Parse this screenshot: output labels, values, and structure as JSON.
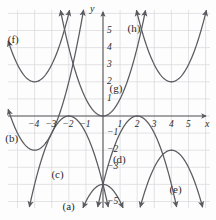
{
  "figure": {
    "kind": "coordinate-grid-parabolas",
    "background_color": "#fdfdfd",
    "grid_color": "#d8d8dc",
    "axis_color": "#58585c",
    "curve_color": "#5a5a60"
  },
  "axes": {
    "x_axis_label": "x",
    "y_axis_label": "y",
    "x_tick_labels": [
      "−4",
      "−3",
      "−2",
      "−1",
      "1",
      "2",
      "3",
      "4",
      "5"
    ],
    "x_tick_values": [
      -4,
      -3,
      -2,
      -1,
      1,
      2,
      3,
      4,
      5
    ],
    "y_tick_labels": [
      "5",
      "4",
      "3",
      "2",
      "1",
      "−1",
      "−2",
      "−3",
      "−5"
    ],
    "y_tick_values": [
      5,
      4,
      3,
      2,
      1,
      -1,
      -2,
      -3,
      -5
    ],
    "xlim": [
      -5.5,
      6.2
    ],
    "ylim": [
      -6.3,
      6.2
    ],
    "grid": true
  },
  "chart_data": {
    "type": "line",
    "title": "",
    "xlabel": "x",
    "ylabel": "y",
    "xlim": [
      -5.5,
      6.2
    ],
    "ylim": [
      -6.3,
      6.2
    ],
    "grid": true,
    "legend": "inline-labels",
    "series": [
      {
        "name": "(a)",
        "label": "(a)",
        "shape": "parabola",
        "opens": "down",
        "vertex": [
          0,
          -4
        ],
        "a": -1,
        "equation": "y = -(x)^2 - 4",
        "label_position": [
          -1.9,
          -5.3
        ]
      },
      {
        "name": "(b)",
        "label": "(b)",
        "shape": "parabola",
        "opens": "up",
        "vertex": [
          -4,
          -2
        ],
        "a": 1,
        "equation": "y = (x + 4)^2 - 2",
        "label_position": [
          -5.25,
          -1.35
        ]
      },
      {
        "name": "(c)",
        "label": "(c)",
        "shape": "parabola",
        "opens": "down",
        "vertex": [
          -2,
          0
        ],
        "a": -1,
        "equation": "y = -(x + 2)^2",
        "label_position": [
          -2.55,
          -3.45
        ]
      },
      {
        "name": "(d)",
        "label": "(d)",
        "shape": "parabola",
        "opens": "down",
        "vertex": [
          2,
          0
        ],
        "a": -1,
        "equation": "y = -(x - 2)^2",
        "label_position": [
          1.05,
          -2.55
        ]
      },
      {
        "name": "(e)",
        "label": "(e)",
        "shape": "parabola",
        "opens": "down",
        "vertex": [
          4,
          -2
        ],
        "a": -1,
        "equation": "y = -(x - 4)^2 - 2",
        "label_position": [
          4.35,
          -4.35
        ]
      },
      {
        "name": "(f)",
        "label": "(f)",
        "shape": "parabola",
        "opens": "up",
        "vertex": [
          -4,
          2
        ],
        "a": 1,
        "equation": "y = (x + 4)^2 + 2",
        "label_position": [
          -5.1,
          4.45
        ]
      },
      {
        "name": "(g)",
        "label": "(g)",
        "shape": "parabola",
        "opens": "up",
        "vertex": [
          0,
          0
        ],
        "a": 1,
        "equation": "y = x^2",
        "label_position": [
          0.85,
          1.55
        ]
      },
      {
        "name": "(h)",
        "label": "(h)",
        "shape": "parabola",
        "opens": "up",
        "vertex": [
          4,
          2
        ],
        "a": 1,
        "equation": "y = (x - 4)^2 + 2",
        "label_position": [
          1.9,
          5.1
        ]
      }
    ]
  }
}
